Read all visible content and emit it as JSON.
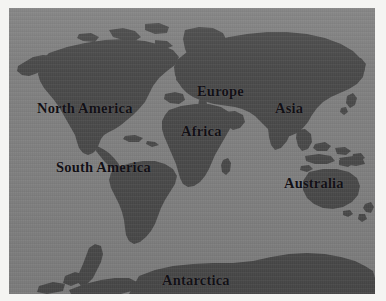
{
  "figure": {
    "type": "world-map",
    "projection": "equirectangular",
    "title_visible": false,
    "colors": {
      "ocean": "#808080",
      "land": "#4a4a4a",
      "label_text": "#121015",
      "paper_margin": "#f4f4f2"
    },
    "plate": {
      "left": 9,
      "top": 8,
      "width": 366,
      "height": 286
    }
  },
  "labels": [
    {
      "id": "north-america",
      "text": "North America"
    },
    {
      "id": "south-america",
      "text": "South America"
    },
    {
      "id": "europe",
      "text": "Europe"
    },
    {
      "id": "africa",
      "text": "Africa"
    },
    {
      "id": "asia",
      "text": "Asia"
    },
    {
      "id": "australia",
      "text": "Australia"
    },
    {
      "id": "antarctica",
      "text": "Antarctica"
    }
  ]
}
